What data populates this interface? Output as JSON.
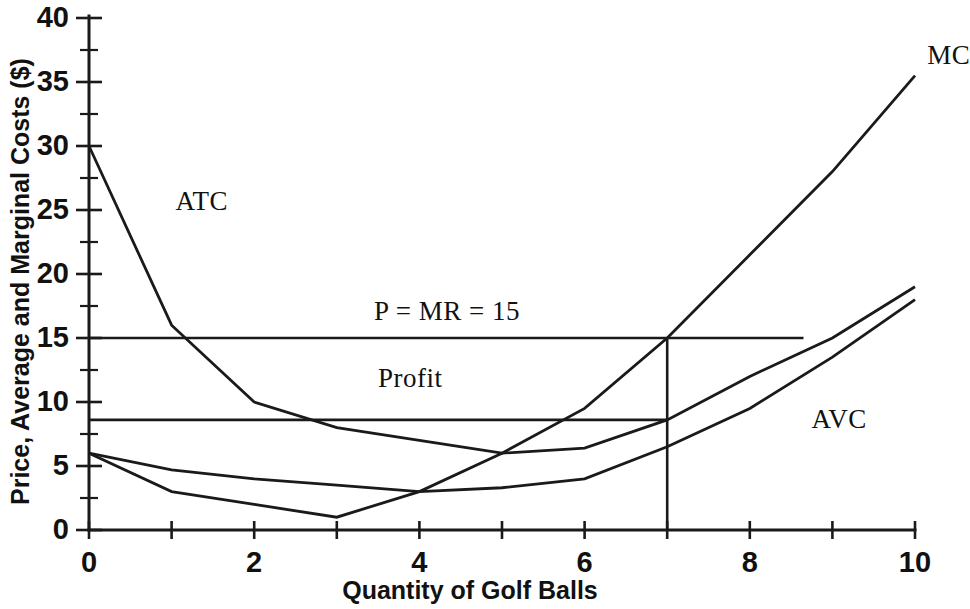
{
  "chart_data": {
    "type": "line",
    "title": "",
    "xlabel": "Quantity of Golf Balls",
    "ylabel": "Price, Average and Marginal Costs ($)",
    "xlim": [
      0,
      10
    ],
    "ylim": [
      0,
      40
    ],
    "xticks": [
      0,
      1,
      2,
      3,
      4,
      5,
      6,
      7,
      8,
      9,
      10
    ],
    "xtick_labels": [
      "0",
      "",
      "2",
      "",
      "4",
      "",
      "6",
      "",
      "8",
      "",
      "10"
    ],
    "xtick_labels_shown": [
      "0",
      "2",
      "4",
      "6",
      "8",
      "10"
    ],
    "yticks": [
      0,
      2.5,
      5,
      7.5,
      10,
      12.5,
      15,
      17.5,
      20,
      22.5,
      25,
      27.5,
      30,
      32.5,
      35,
      37.5,
      40
    ],
    "ytick_labels_shown": [
      "0",
      "5",
      "10",
      "15",
      "20",
      "25",
      "30",
      "35",
      "40"
    ],
    "grid": false,
    "legend": "inline-labels",
    "line_color": "#1a1a1a",
    "series": [
      {
        "name": "ATC",
        "label": "ATC",
        "label_x": 1.0,
        "label_y": 25.6,
        "x": [
          0,
          1,
          2,
          3,
          4,
          5,
          6,
          7,
          8,
          9,
          10
        ],
        "values": [
          30,
          16,
          10,
          8,
          7,
          6,
          6.4,
          8.6,
          12,
          15,
          19
        ]
      },
      {
        "name": "AVC",
        "label": "AVC",
        "label_x": 8.7,
        "label_y": 8.6,
        "x": [
          0,
          1,
          2,
          3,
          4,
          5,
          6,
          7,
          8,
          9,
          10
        ],
        "values": [
          6,
          4.7,
          4,
          3.5,
          3,
          3.3,
          4,
          6.5,
          9.5,
          13.5,
          18
        ]
      },
      {
        "name": "MC",
        "label": "MC",
        "label_x": 10.1,
        "label_y": 37.0,
        "x": [
          0,
          1,
          2,
          3,
          4,
          5,
          6,
          7,
          8,
          9,
          10
        ],
        "values": [
          6,
          3,
          2,
          1,
          3,
          6,
          9.5,
          15,
          21.5,
          28,
          35.5
        ]
      }
    ],
    "annotations": [
      {
        "name": "price-mr-line",
        "text": "P = MR = 15",
        "value": 15,
        "type": "horizontal-line",
        "line_from_x": 0,
        "line_to_x": 8.65,
        "label_x": 3.45,
        "label_y": 17.0
      },
      {
        "name": "atc-at-q-line",
        "text": "",
        "value": 8.6,
        "type": "horizontal-line",
        "line_from_x": 0,
        "line_to_x": 7,
        "label_x": 0,
        "label_y": 0
      },
      {
        "name": "profit-region",
        "text": "Profit",
        "type": "region-label",
        "label_x": 3.5,
        "label_y": 11.8
      },
      {
        "name": "quantity-line",
        "text": "",
        "value": 7,
        "type": "vertical-line",
        "line_from_y": 0,
        "line_to_y": 15
      }
    ]
  }
}
